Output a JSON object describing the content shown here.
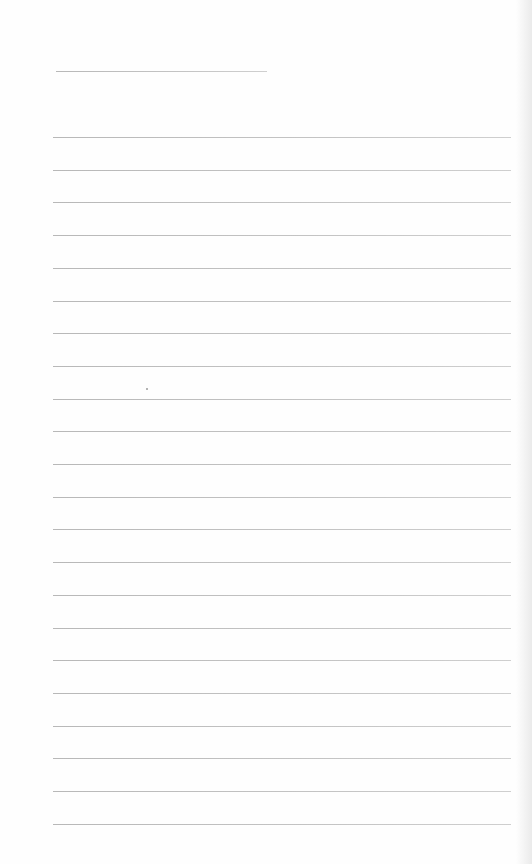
{
  "document": {
    "type": "lined-paper",
    "background": "#fefefe",
    "rule_color": "#c0c0c0",
    "header_line": {
      "x": 56,
      "y": 71,
      "width": 211
    },
    "lines": {
      "count": 22,
      "start_y": 137,
      "spacing": 32.7,
      "x": 53,
      "width": 458
    },
    "speck": {
      "x": 146,
      "y": 388
    }
  }
}
